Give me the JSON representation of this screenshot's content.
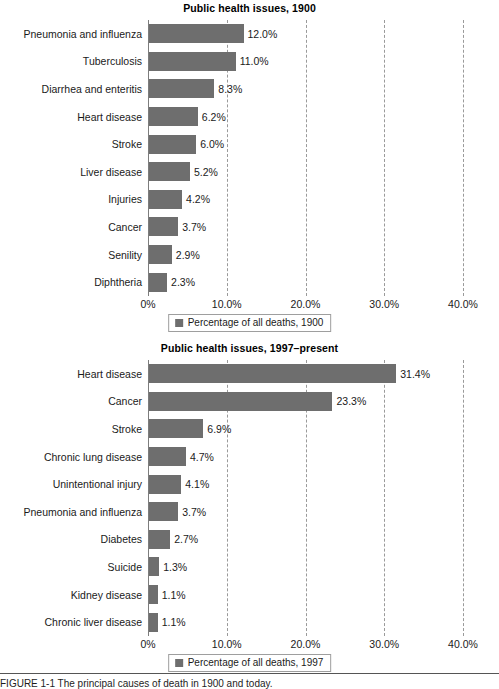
{
  "axis": {
    "origin_px": 148,
    "px_per_percent": 7.875,
    "ticks": [
      "0%",
      "10.0%",
      "20.0%",
      "30.0%",
      "40.0%"
    ],
    "tick_values": [
      0,
      10,
      20,
      30,
      40
    ]
  },
  "colors": {
    "bar": "#6e6e6e",
    "gridline": "#9a9a9a",
    "axis": "#7d7d7d",
    "text": "#1a1a1a",
    "background": "#ffffff"
  },
  "footer": {
    "caption": "FIGURE 1-1   The principal causes of death in 1900 and today."
  },
  "chart_data": [
    {
      "type": "bar",
      "orientation": "horizontal",
      "title": "Public health issues, 1900",
      "xlabel": "",
      "ylabel": "",
      "xlim": [
        0,
        40
      ],
      "grid": true,
      "legend_position": "bottom",
      "legend": [
        "Percentage of all deaths, 1900"
      ],
      "series_name": "Percentage of all deaths, 1900",
      "categories": [
        "Pneumonia and influenza",
        "Tuberculosis",
        "Diarrhea and enteritis",
        "Heart disease",
        "Stroke",
        "Liver disease",
        "Injuries",
        "Cancer",
        "Senility",
        "Diphtheria"
      ],
      "values": [
        12.0,
        11.0,
        8.3,
        6.2,
        6.0,
        5.2,
        4.2,
        3.7,
        2.9,
        2.3
      ],
      "value_labels": [
        "12.0%",
        "11.0%",
        "8.3%",
        "6.2%",
        "6.0%",
        "5.2%",
        "4.2%",
        "3.7%",
        "2.9%",
        "2.3%"
      ]
    },
    {
      "type": "bar",
      "orientation": "horizontal",
      "title": "Public health issues, 1997–present",
      "xlabel": "",
      "ylabel": "",
      "xlim": [
        0,
        40
      ],
      "grid": true,
      "legend_position": "bottom",
      "legend": [
        "Percentage of all deaths, 1997"
      ],
      "series_name": "Percentage of all deaths, 1997",
      "categories": [
        "Heart disease",
        "Cancer",
        "Stroke",
        "Chronic lung disease",
        "Unintentional injury",
        "Pneumonia and influenza",
        "Diabetes",
        "Suicide",
        "Kidney disease",
        "Chronic liver disease"
      ],
      "values": [
        31.4,
        23.3,
        6.9,
        4.7,
        4.1,
        3.7,
        2.7,
        1.3,
        1.1,
        1.1
      ],
      "value_labels": [
        "31.4%",
        "23.3%",
        "6.9%",
        "4.7%",
        "4.1%",
        "3.7%",
        "2.7%",
        "1.3%",
        "1.1%",
        "1.1%"
      ]
    }
  ]
}
